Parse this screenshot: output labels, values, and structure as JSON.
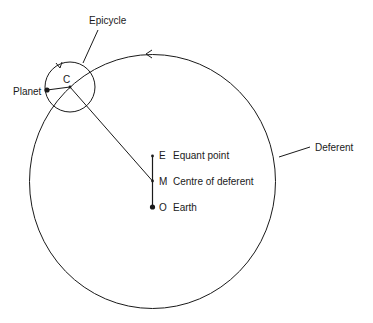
{
  "diagram": {
    "type": "ptolemaic-model",
    "labels": {
      "epicycle": "Epicycle",
      "planet": "Planet",
      "epicycle_centre": "C",
      "deferent": "Deferent",
      "equant_letter": "E",
      "equant": "Equant point",
      "centre_letter": "M",
      "centre": "Centre of deferent",
      "earth_letter": "O",
      "earth": "Earth"
    },
    "colors": {
      "stroke": "#1a1a1a",
      "background": "#ffffff"
    }
  }
}
